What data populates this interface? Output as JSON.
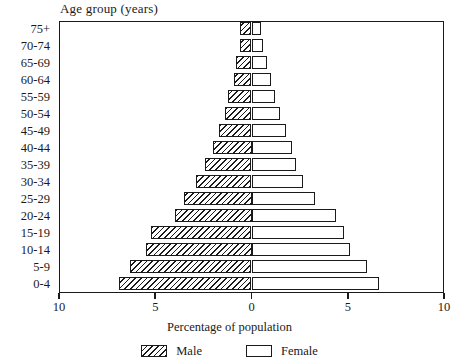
{
  "chart_data": {
    "type": "bar",
    "subtype": "population-pyramid",
    "title": "",
    "xlabel": "Percentage of population",
    "ylabel": "Age group (years)",
    "categories": [
      "0-4",
      "5-9",
      "10-14",
      "15-19",
      "20-24",
      "25-29",
      "30-34",
      "35-39",
      "40-44",
      "45-49",
      "50-54",
      "55-59",
      "60-64",
      "65-69",
      "70-74",
      "75+"
    ],
    "series": [
      {
        "name": "Male",
        "values": [
          6.9,
          6.3,
          5.5,
          5.2,
          4.0,
          3.5,
          2.9,
          2.4,
          2.0,
          1.7,
          1.4,
          1.2,
          0.9,
          0.8,
          0.6,
          0.6
        ]
      },
      {
        "name": "Female",
        "values": [
          6.6,
          6.0,
          5.1,
          4.8,
          4.4,
          3.3,
          2.7,
          2.3,
          2.1,
          1.8,
          1.5,
          1.2,
          1.0,
          0.8,
          0.6,
          0.5
        ]
      }
    ],
    "xlim": [
      -10,
      10
    ],
    "x_ticks": [
      {
        "value": -10,
        "label": "10"
      },
      {
        "value": -5,
        "label": "5"
      },
      {
        "value": 0,
        "label": "0"
      },
      {
        "value": 5,
        "label": "5"
      },
      {
        "value": 10,
        "label": "10"
      }
    ],
    "grid": false,
    "legend_position": "bottom",
    "legend": [
      {
        "label": "Male",
        "pattern": "diagonal-hatch"
      },
      {
        "label": "Female",
        "pattern": "solid-white"
      }
    ],
    "colors": {
      "outline": "#1a1a1a",
      "male_fill": "#ffffff",
      "female_fill": "#ffffff",
      "background": "#ffffff"
    }
  }
}
